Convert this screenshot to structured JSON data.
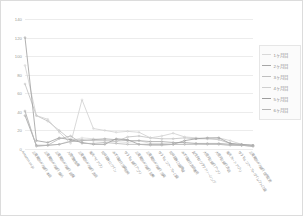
{
  "chart_data": {
    "type": "line",
    "title": "",
    "xlabel": "",
    "ylabel": "",
    "ylim": [
      0,
      140
    ],
    "ytick_step": 20,
    "yticks": [
      0,
      20,
      40,
      60,
      80,
      100,
      120,
      140
    ],
    "grid": true,
    "legend_position": "right",
    "categories": [
      "Amazon.co.jp",
      "三菱東京UFJ銀行 本店",
      "三菱東京UFJ銀行 振込",
      "三菱東京UFJ銀行 店舗",
      "入間信用金庫",
      "三菱東京UFJ銀行 支店",
      "楽天ペイアプリ",
      "松井証券 ログイン",
      "みずほ銀行 残高照会",
      "ゆうちょ銀行 アプリ",
      "三菱東京UFJ銀行 記帳",
      "三菱東京UFJ銀行 残高",
      "ゆうちょファースト口座",
      "松井証券 口座開設",
      "みずほ銀行 支店番号",
      "女性向けクラウドソーシング",
      "大垣共立銀行 アプリ",
      "大垣共立銀行 支店",
      "楽天カード アプリ",
      "ゆうちょファーストダイレクト口座",
      "三菱東京UFJ銀行 住所変更"
    ],
    "series": [
      {
        "name": "1ヶ月目",
        "color": "#d9d9d9",
        "values": [
          40,
          3,
          4,
          5,
          9,
          12,
          11,
          10,
          8,
          7,
          9,
          6,
          6,
          5,
          5,
          6,
          5,
          5,
          4,
          4,
          3
        ]
      },
      {
        "name": "2ヶ月目",
        "color": "#a6a6a6",
        "values": [
          36,
          4,
          4,
          5,
          8,
          9,
          10,
          11,
          10,
          9,
          9,
          8,
          8,
          7,
          7,
          6,
          6,
          6,
          5,
          4,
          3
        ]
      },
      {
        "name": "3ヶ月目",
        "color": "#bfbfbf",
        "values": [
          70,
          36,
          30,
          20,
          10,
          10,
          9,
          9,
          8,
          13,
          14,
          12,
          11,
          11,
          12,
          11,
          11,
          10,
          6,
          4,
          4
        ]
      },
      {
        "name": "4ヶ月目",
        "color": "#cfcfcf",
        "values": [
          90,
          36,
          32,
          18,
          6,
          53,
          22,
          20,
          18,
          19,
          18,
          12,
          14,
          17,
          13,
          12,
          11,
          12,
          9,
          5,
          4
        ]
      },
      {
        "name": "5ヶ月目",
        "color": "#9d9d9d",
        "values": [
          120,
          9,
          7,
          12,
          10,
          7,
          5,
          5,
          11,
          10,
          5,
          5,
          5,
          5,
          9,
          11,
          12,
          12,
          6,
          5,
          4
        ]
      },
      {
        "name": "6ヶ月目",
        "color": "#b5b5b5",
        "values": [
          41,
          3,
          4,
          11,
          14,
          6,
          6,
          7,
          6,
          5,
          5,
          4,
          4,
          5,
          5,
          5,
          5,
          5,
          4,
          4,
          3
        ]
      }
    ]
  },
  "legend": {
    "items": [
      {
        "label": "1ヶ月目"
      },
      {
        "label": "2ヶ月目"
      },
      {
        "label": "3ヶ月目"
      },
      {
        "label": "4ヶ月目"
      },
      {
        "label": "5ヶ月目"
      },
      {
        "label": "6ヶ月目"
      }
    ]
  }
}
